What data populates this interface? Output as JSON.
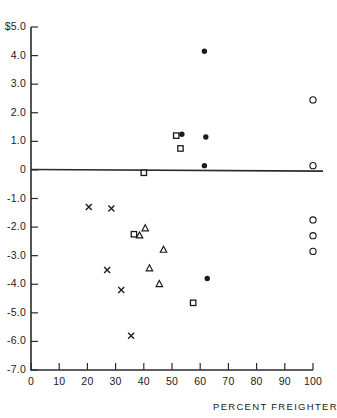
{
  "chart_data": {
    "type": "scatter",
    "title": "",
    "xlabel": "PERCENT FREIGHTER",
    "ylabel": "",
    "xlim": [
      0,
      100
    ],
    "ylim": [
      -7.0,
      5.0
    ],
    "grid": false,
    "legend": "none",
    "currency_prefix": "$",
    "y_zero_reference_line": 0,
    "xticks": [
      0,
      10,
      20,
      30,
      40,
      50,
      60,
      70,
      80,
      90,
      100
    ],
    "xticklabels": [
      "0",
      "10",
      "20",
      "30",
      "40",
      "50",
      "60",
      "70",
      "80",
      "90",
      "100"
    ],
    "yticks": [
      5.0,
      4.0,
      3.0,
      2.0,
      1.0,
      0,
      -1.0,
      -2.0,
      -3.0,
      -4.0,
      -5.0,
      -6.0,
      -7.0
    ],
    "yticklabels": [
      "$5.0",
      "4.0",
      "3.0",
      "2.0",
      "1.0",
      "0",
      "-1.0",
      "-2.0",
      "-3.0",
      "-4.0",
      "-5.0",
      "-6.0",
      "-7.0"
    ],
    "series": [
      {
        "name": "filled-circle",
        "marker": "filled-circle",
        "points": [
          {
            "x": 61.5,
            "y": 4.15
          },
          {
            "x": 53.5,
            "y": 1.25
          },
          {
            "x": 62.0,
            "y": 1.15
          },
          {
            "x": 61.5,
            "y": 0.15
          },
          {
            "x": 62.5,
            "y": -3.8
          }
        ]
      },
      {
        "name": "open-circle",
        "marker": "open-circle",
        "points": [
          {
            "x": 100.0,
            "y": 2.45
          },
          {
            "x": 100.0,
            "y": 0.15
          },
          {
            "x": 100.0,
            "y": -1.75
          },
          {
            "x": 100.0,
            "y": -2.3
          },
          {
            "x": 100.0,
            "y": -2.85
          }
        ]
      },
      {
        "name": "open-square",
        "marker": "open-square",
        "points": [
          {
            "x": 51.5,
            "y": 1.2
          },
          {
            "x": 53.0,
            "y": 0.75
          },
          {
            "x": 40.0,
            "y": -0.1
          },
          {
            "x": 36.5,
            "y": -2.25
          },
          {
            "x": 57.5,
            "y": -4.65
          }
        ]
      },
      {
        "name": "open-triangle",
        "marker": "open-triangle",
        "points": [
          {
            "x": 40.5,
            "y": -2.05
          },
          {
            "x": 38.5,
            "y": -2.3
          },
          {
            "x": 47.0,
            "y": -2.8
          },
          {
            "x": 42.0,
            "y": -3.45
          },
          {
            "x": 45.5,
            "y": -4.0
          }
        ]
      },
      {
        "name": "cross",
        "marker": "cross",
        "points": [
          {
            "x": 20.5,
            "y": -1.3
          },
          {
            "x": 28.5,
            "y": -1.35
          },
          {
            "x": 27.0,
            "y": -3.5
          },
          {
            "x": 32.0,
            "y": -4.2
          },
          {
            "x": 35.5,
            "y": -5.8
          }
        ]
      }
    ]
  },
  "geometry": {
    "px_x0": 31,
    "px_x100": 313,
    "px_y_top": 27,
    "px_y_bottom": 370,
    "y_top_value": 5.0,
    "y_bottom_value": -7.0,
    "tick_len": 7,
    "zero_line_right_px": 323
  },
  "colors": {
    "ink": "#1a1a1a",
    "axis": "#2b2b2b",
    "background": "#ffffff"
  }
}
